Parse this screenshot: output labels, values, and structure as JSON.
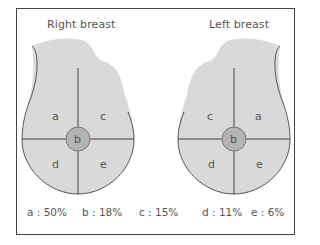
{
  "diagram": {
    "right": {
      "title": "Right breast",
      "quadrants": {
        "upper_left": "a",
        "upper_right": "c",
        "center": "b",
        "lower_left": "d",
        "lower_right": "e"
      }
    },
    "left": {
      "title": "Left breast",
      "quadrants": {
        "upper_left": "c",
        "upper_right": "a",
        "center": "b",
        "lower_left": "d",
        "lower_right": "e"
      }
    },
    "legend": [
      {
        "label": "a : 50%"
      },
      {
        "label": "b : 18%"
      },
      {
        "label": "c : 15%"
      },
      {
        "label": "d : 11%"
      },
      {
        "label": "e : 6%"
      }
    ],
    "colors": {
      "fill": "#d9d9d9",
      "center_fill": "#b3b3b3",
      "stroke": "#555555",
      "frame": "#444444"
    }
  }
}
